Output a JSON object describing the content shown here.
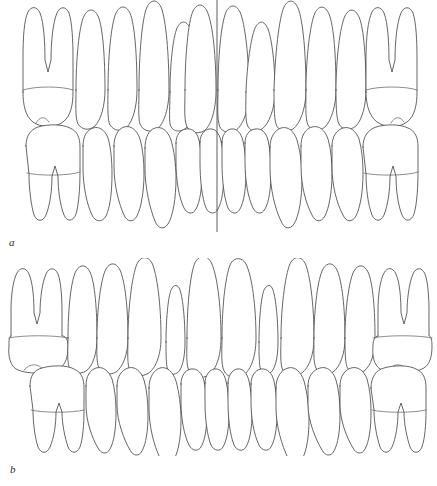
{
  "figure": {
    "background_color": "#ffffff",
    "line_color": "#4a4a4a",
    "detail_line_color": "#5a5a5a"
  },
  "panels": [
    {
      "id": "a",
      "label": "a",
      "caption": "Normal alignment with midline reference line",
      "has_midline": true,
      "midline": {
        "name": "dental-midline",
        "x": 217,
        "y_top": 0,
        "y_bottom": 248,
        "color": "#4a4a4a"
      },
      "upper_arch_label": "maxillary teeth",
      "lower_arch_label": "mandibular teeth",
      "upper_tooth_count": 12,
      "lower_tooth_count": 12,
      "upper_teeth": [
        "upper-right-first-molar",
        "upper-right-second-premolar",
        "upper-right-first-premolar",
        "upper-right-canine",
        "upper-right-lateral-incisor",
        "upper-right-central-incisor",
        "upper-left-central-incisor",
        "upper-left-lateral-incisor",
        "upper-left-canine",
        "upper-left-first-premolar",
        "upper-left-second-premolar",
        "upper-left-first-molar"
      ],
      "lower_teeth": [
        "lower-right-first-molar",
        "lower-right-second-premolar",
        "lower-right-first-premolar",
        "lower-right-canine",
        "lower-right-lateral-incisor",
        "lower-right-central-incisor",
        "lower-left-central-incisor",
        "lower-left-lateral-incisor",
        "lower-left-canine",
        "lower-left-first-premolar",
        "lower-left-second-premolar",
        "lower-left-first-molar"
      ]
    },
    {
      "id": "b",
      "label": "b",
      "caption": "Alignment with reduced peg-shaped lateral incisors",
      "has_midline": false,
      "upper_arch_label": "maxillary teeth",
      "lower_arch_label": "mandibular teeth",
      "upper_tooth_count": 12,
      "lower_tooth_count": 12,
      "upper_teeth": [
        "upper-right-first-molar",
        "upper-right-second-premolar",
        "upper-right-first-premolar",
        "upper-right-canine",
        "upper-right-peg-lateral-incisor",
        "upper-right-central-incisor",
        "upper-left-central-incisor",
        "upper-left-peg-lateral-incisor",
        "upper-left-canine",
        "upper-left-first-premolar",
        "upper-left-second-premolar",
        "upper-left-first-molar"
      ],
      "lower_teeth": [
        "lower-right-first-molar",
        "lower-right-second-premolar",
        "lower-right-first-premolar",
        "lower-right-canine",
        "lower-right-lateral-incisor",
        "lower-right-central-incisor",
        "lower-left-central-incisor",
        "lower-left-lateral-incisor",
        "lower-left-canine",
        "lower-left-first-premolar",
        "lower-left-second-premolar",
        "lower-left-first-molar"
      ]
    }
  ]
}
